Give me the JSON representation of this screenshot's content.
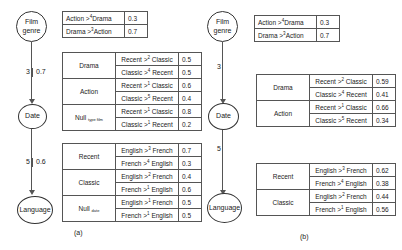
{
  "panel_a": {
    "caption": "(a)",
    "nodes": [
      "Film genre",
      "Date",
      "Language"
    ],
    "edge1": {
      "left": "3",
      "right": "0.7"
    },
    "edge2": {
      "left": "5",
      "right": "0.6"
    },
    "genre_table": [
      {
        "pref": "Action >",
        "sup": "4",
        "pref2": "Drama",
        "value": "0.3"
      },
      {
        "pref": "Drama >",
        "sup": "3",
        "pref2": "Action",
        "value": "0.7"
      }
    ],
    "date_table": [
      {
        "group": "Drama",
        "rows": [
          {
            "a": "Recent >",
            "sup": "2",
            "b": " Classic",
            "value": "0.5"
          },
          {
            "a": "Classic >",
            "sup": "4",
            "b": " Recent",
            "value": "0.5"
          }
        ]
      },
      {
        "group": "Action",
        "rows": [
          {
            "a": "Recent >",
            "sup": "1",
            "b": " Classic",
            "value": "0.6"
          },
          {
            "a": "Classic >",
            "sup": "5",
            "b": " Recent",
            "value": "0.4"
          }
        ]
      },
      {
        "group": "Null",
        "group_sub": "type film",
        "rows": [
          {
            "a": "Recent >",
            "sup": "1",
            "b": " Classic",
            "value": "0.8"
          },
          {
            "a": "Classic >",
            "sup": "1",
            "b": " Recent",
            "value": "0.2"
          }
        ]
      }
    ],
    "lang_table": [
      {
        "group": "Recent",
        "rows": [
          {
            "a": "English >",
            "sup": "3",
            "b": " French",
            "value": "0.7"
          },
          {
            "a": "French >",
            "sup": "4",
            "b": " English",
            "value": "0.3"
          }
        ]
      },
      {
        "group": "Classic",
        "rows": [
          {
            "a": "English >",
            "sup": "2",
            "b": " French",
            "value": "0.4"
          },
          {
            "a": "French >",
            "sup": "1",
            "b": " English",
            "value": "0.6"
          }
        ]
      },
      {
        "group": "Null",
        "group_sub": "date",
        "rows": [
          {
            "a": "English >",
            "sup": "1",
            "b": " French",
            "value": "0.5"
          },
          {
            "a": "French >",
            "sup": "1",
            "b": " English",
            "value": "0.5"
          }
        ]
      }
    ]
  },
  "panel_b": {
    "caption": "(b)",
    "nodes": [
      "Film genre",
      "Date",
      "Language"
    ],
    "edge1": {
      "left": "3"
    },
    "edge2": {
      "left": "5"
    },
    "genre_table": [
      {
        "pref": "Action >",
        "sup": "4",
        "pref2": "Drama",
        "value": "0.3"
      },
      {
        "pref": "Drama >",
        "sup": "3",
        "pref2": "Action",
        "value": "0.7"
      }
    ],
    "date_table": [
      {
        "group": "Drama",
        "rows": [
          {
            "a": "Recent >",
            "sup": "2",
            "b": " Classic",
            "value": "0.59"
          },
          {
            "a": "Classic >",
            "sup": "4",
            "b": " Recent",
            "value": "0.41"
          }
        ]
      },
      {
        "group": "Action",
        "rows": [
          {
            "a": "Recent >",
            "sup": "1",
            "b": " Classic",
            "value": "0.66"
          },
          {
            "a": "Classic >",
            "sup": "5",
            "b": " Recent",
            "value": "0.34"
          }
        ]
      }
    ],
    "lang_table": [
      {
        "group": "Recent",
        "rows": [
          {
            "a": "English >",
            "sup": "3",
            "b": " French",
            "value": "0.62"
          },
          {
            "a": "French >",
            "sup": "4",
            "b": " English",
            "value": "0.38"
          }
        ]
      },
      {
        "group": "Classic",
        "rows": [
          {
            "a": "English >",
            "sup": "2",
            "b": " French",
            "value": "0.44"
          },
          {
            "a": "French >",
            "sup": "1",
            "b": " English",
            "value": "0.56"
          }
        ]
      }
    ]
  }
}
